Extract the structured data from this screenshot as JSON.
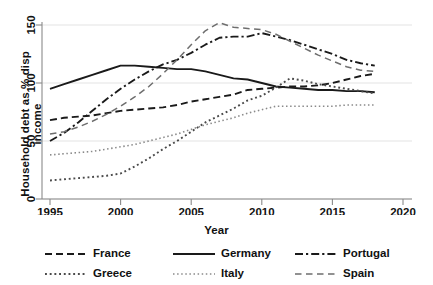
{
  "chart_data": {
    "type": "line",
    "title": "",
    "xlabel": "Year",
    "ylabel": "Household debt as % disp income",
    "xlim": [
      1995,
      2020
    ],
    "ylim": [
      0,
      160
    ],
    "xticks": [
      1995,
      2000,
      2005,
      2010,
      2015,
      2020
    ],
    "yticks": [
      0,
      50,
      100,
      150
    ],
    "grid": "horizontal",
    "legend_position": "bottom",
    "x": [
      1995,
      1996,
      1997,
      1998,
      1999,
      2000,
      2001,
      2002,
      2003,
      2004,
      2005,
      2006,
      2007,
      2008,
      2009,
      2010,
      2011,
      2012,
      2013,
      2014,
      2015,
      2016,
      2017,
      2018
    ],
    "series": [
      {
        "name": "France",
        "dash": "dashed",
        "color": "#1a1a1a",
        "values": [
          68,
          70,
          71,
          72,
          74,
          76,
          77,
          78,
          79,
          81,
          84,
          86,
          88,
          90,
          94,
          95,
          96,
          97,
          97,
          98,
          100,
          103,
          106,
          108
        ]
      },
      {
        "name": "Germany",
        "dash": "solid",
        "color": "#1a1a1a",
        "values": [
          95,
          99,
          103,
          107,
          111,
          115,
          115,
          114,
          113,
          112,
          112,
          110,
          107,
          104,
          103,
          100,
          97,
          96,
          95,
          94,
          94,
          93,
          93,
          92
        ]
      },
      {
        "name": "Portugal",
        "dash": "dash-dot",
        "color": "#1a1a1a",
        "values": [
          50,
          57,
          66,
          76,
          86,
          95,
          103,
          110,
          116,
          120,
          126,
          133,
          139,
          140,
          140,
          143,
          140,
          137,
          133,
          129,
          125,
          120,
          117,
          115
        ]
      },
      {
        "name": "Greece",
        "dash": "dotted",
        "color": "#4a4a4a",
        "values": [
          16,
          17,
          18,
          19,
          20,
          22,
          28,
          35,
          43,
          50,
          58,
          66,
          72,
          78,
          85,
          89,
          96,
          104,
          102,
          99,
          97,
          95,
          93,
          91
        ]
      },
      {
        "name": "Italy",
        "dash": "fine-dotted",
        "color": "#8a8a8a",
        "values": [
          38,
          39,
          40,
          41,
          43,
          45,
          47,
          50,
          53,
          56,
          60,
          64,
          67,
          70,
          74,
          77,
          80,
          80,
          80,
          80,
          80,
          81,
          81,
          81
        ]
      },
      {
        "name": "Spain",
        "dash": "long-dashed",
        "color": "#6e6e6e",
        "values": [
          56,
          58,
          62,
          67,
          73,
          80,
          88,
          97,
          108,
          120,
          133,
          145,
          152,
          148,
          147,
          146,
          142,
          136,
          130,
          124,
          119,
          114,
          111,
          110
        ]
      }
    ]
  },
  "legend": {
    "items": [
      {
        "label": "France",
        "style": "dashed"
      },
      {
        "label": "Germany",
        "style": "solid"
      },
      {
        "label": "Portugal",
        "style": "dash-dot"
      },
      {
        "label": "Greece",
        "style": "dotted"
      },
      {
        "label": "Italy",
        "style": "fine-dotted"
      },
      {
        "label": "Spain",
        "style": "long-dashed"
      }
    ]
  }
}
